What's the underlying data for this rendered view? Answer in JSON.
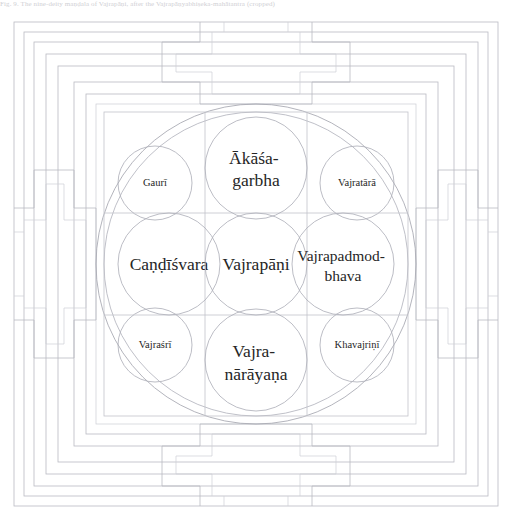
{
  "page": {
    "width": 512,
    "height": 524,
    "background_color": "#ffffff",
    "ink_color": "#2b2b2b",
    "line_color": "#b9bac2"
  },
  "caption": {
    "text": "Fig. 9. The nine-deity maṇḍala of Vajrapāṇi, after the Vajrapāṇyabhiṣeka-mahātantra (cropped)"
  },
  "diagram": {
    "type": "mandala",
    "outer_frame": {
      "name": "nested-square-walls",
      "ring_count": 7,
      "description": "Concentric square walls of the maṇḍala palace"
    },
    "gates": [
      {
        "id": "gate-north",
        "position": "top",
        "shape": "T"
      },
      {
        "id": "gate-south",
        "position": "bottom",
        "shape": "inverted-T"
      },
      {
        "id": "gate-west",
        "position": "left",
        "shape": "rotated-T"
      },
      {
        "id": "gate-east",
        "position": "right",
        "shape": "rotated-T"
      }
    ],
    "enclosing_circles": [
      {
        "id": "outer-circle",
        "radius": 160
      },
      {
        "id": "inner-circle",
        "radius": 152
      }
    ],
    "grid": {
      "rows": 3,
      "columns": 3,
      "left": 108,
      "top": 108,
      "size": 304
    },
    "cells": [
      {
        "id": "cell-nw",
        "row": 0,
        "col": 0,
        "circle_size": "small",
        "label": "Gaurī",
        "label_lines": [
          "Gaurī"
        ],
        "label_size": "small"
      },
      {
        "id": "cell-n",
        "row": 0,
        "col": 1,
        "circle_size": "large",
        "label": "Ākāśa-garbha",
        "label_lines": [
          "Ākāśa-",
          "garbha"
        ],
        "label_size": "large"
      },
      {
        "id": "cell-ne",
        "row": 0,
        "col": 2,
        "circle_size": "small",
        "label": "Vajratārā",
        "label_lines": [
          "Vajratārā"
        ],
        "label_size": "small"
      },
      {
        "id": "cell-w",
        "row": 1,
        "col": 0,
        "circle_size": "large",
        "label": "Caṇḍīśvara",
        "label_lines": [
          "Caṇḍīśvara"
        ],
        "label_size": "large"
      },
      {
        "id": "cell-center",
        "row": 1,
        "col": 1,
        "circle_size": "large",
        "label": "Vajrapāṇi",
        "label_lines": [
          "Vajrapāṇi"
        ],
        "label_size": "large"
      },
      {
        "id": "cell-e",
        "row": 1,
        "col": 2,
        "circle_size": "large",
        "label": "Vajrapadmod-bhava",
        "label_lines": [
          "Vajrapadmod-",
          "bhava"
        ],
        "label_size": "medium"
      },
      {
        "id": "cell-sw",
        "row": 2,
        "col": 0,
        "circle_size": "small",
        "label": "Vajraśrī",
        "label_lines": [
          "Vajraśrī"
        ],
        "label_size": "small"
      },
      {
        "id": "cell-s",
        "row": 2,
        "col": 1,
        "circle_size": "large",
        "label": "Vajra-nārāyaṇa",
        "label_lines": [
          "Vajra-",
          "nārāyaṇa"
        ],
        "label_size": "large"
      },
      {
        "id": "cell-se",
        "row": 2,
        "col": 2,
        "circle_size": "small",
        "label": "Khavajriṇī",
        "label_lines": [
          "Khavajriṇī"
        ],
        "label_size": "small"
      }
    ]
  }
}
